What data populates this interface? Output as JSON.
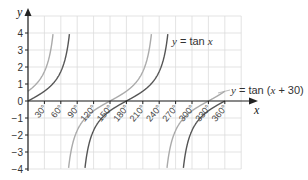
{
  "chart_data": {
    "type": "line",
    "title": "",
    "xlabel": "x",
    "ylabel": "y",
    "xlim": [
      0,
      390
    ],
    "ylim": [
      -4,
      5
    ],
    "grid": true,
    "x_ticks": [
      30,
      60,
      90,
      120,
      150,
      180,
      210,
      240,
      270,
      300,
      330,
      360
    ],
    "x_tick_labels": [
      "30°",
      "60°",
      "90°",
      "120°",
      "150°",
      "180°",
      "210°",
      "240°",
      "270°",
      "300°",
      "330°",
      "360°"
    ],
    "y_ticks": [
      -4,
      -3,
      -2,
      -1,
      0,
      1,
      2,
      3,
      4
    ],
    "y_tick_labels": [
      "−4",
      "−3",
      "−2",
      "−1",
      "0",
      "1",
      "2",
      "3",
      "4"
    ],
    "series": [
      {
        "name": "y = tan x",
        "function": "tan(x)",
        "color": "#555555",
        "asymptotes": [
          90,
          270
        ],
        "zeros": [
          0,
          180,
          360
        ],
        "label": "y = tan x",
        "label_pos": {
          "x": 172,
          "y": 45
        }
      },
      {
        "name": "y = tan (x + 30)",
        "function": "tan(x + 30)",
        "color": "#aaaaaa",
        "asymptotes": [
          60,
          240
        ],
        "zeros": [
          150,
          330
        ],
        "label": "y = tan (x + 30)",
        "label_pos": {
          "x": 231,
          "y": 94
        }
      }
    ],
    "legend": "inline labels"
  },
  "labels": {
    "y_axis": "y",
    "x_axis": "x",
    "tan_x_prefix": "y",
    "tan_x_rest": " = tan ",
    "tan_x_var": "x",
    "shift_prefix": "y",
    "shift_rest1": " = tan (",
    "shift_var": "x",
    "shift_rest2": " + 30)"
  }
}
